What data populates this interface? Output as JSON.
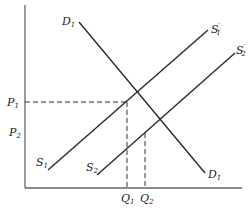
{
  "diagram": {
    "type": "supply-demand",
    "axes": {
      "y_label": "",
      "x_label": ""
    },
    "price_labels": [
      {
        "main": "P",
        "sub": "1"
      },
      {
        "main": "P",
        "sub": "2"
      }
    ],
    "quantity_labels": [
      {
        "main": "Q",
        "sub": "1"
      },
      {
        "main": "Q",
        "sub": "2"
      }
    ],
    "curves": {
      "demand": {
        "start_label": {
          "main": "D",
          "sub": "1"
        },
        "end_label": {
          "main": "D",
          "sub": "1"
        }
      },
      "supply1": {
        "start_label": {
          "main": "S",
          "sub": "1"
        },
        "end_label": {
          "main": "S",
          "sub": "1",
          "prime": "′"
        }
      },
      "supply2": {
        "start_label": {
          "main": "S",
          "sub": "2"
        },
        "end_label": {
          "main": "S",
          "sub": "2",
          "prime": "′"
        }
      }
    },
    "colors": {
      "line": "#2a2a2a",
      "axis": "#555555",
      "dash": "#333333"
    }
  }
}
